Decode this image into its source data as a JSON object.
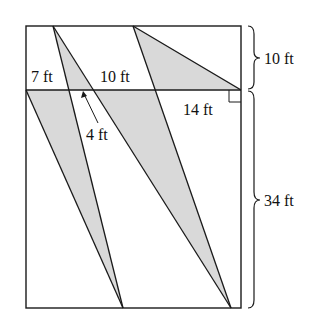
{
  "diagram": {
    "type": "geometry-figure",
    "labels": {
      "top_left_segment": "7 ft",
      "top_middle_segment": "10 ft",
      "right_segment": "14 ft",
      "inner_gap": "4 ft",
      "top_height": "10 ft",
      "bottom_height": "34 ft"
    },
    "colors": {
      "stroke": "#1a1a1a",
      "shade": "#d9d9d9",
      "background": "#ffffff"
    },
    "shaded_regions": 3
  }
}
